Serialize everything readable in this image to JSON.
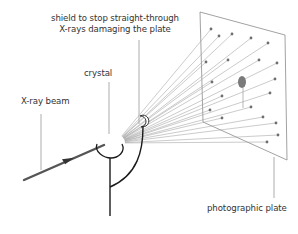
{
  "diagram": {
    "labels": {
      "shield_line1": "shield to stop straight-through",
      "shield_line2": "X-rays damaging the plate",
      "crystal": "crystal",
      "beam": "X-ray beam",
      "plate": "photographic plate"
    },
    "colors": {
      "beam": "#555555",
      "rays": "#9a9a9a",
      "plate_edge": "#888888",
      "spots": "#777777",
      "support": "#1a1a1a",
      "text": "#333333",
      "leader": "#888888"
    },
    "components": [
      "X-ray beam",
      "crystal",
      "shield",
      "diffracted rays",
      "photographic plate",
      "support stand"
    ]
  }
}
